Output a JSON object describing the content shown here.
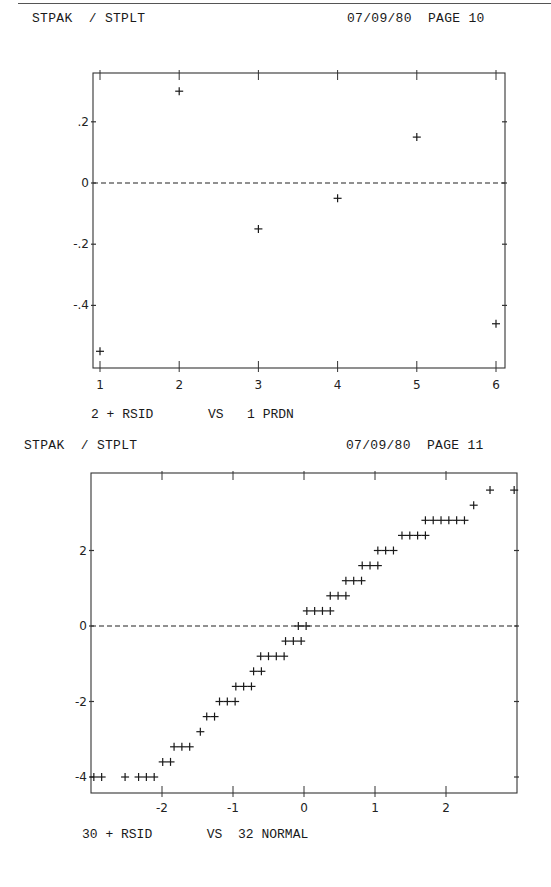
{
  "pages": [
    {
      "header_left": "STPAK  / STPLT",
      "header_right": "07/09/80  PAGE 10",
      "caption": "2 + RSID       VS   1 PRDN"
    },
    {
      "header_left": "STPAK  / STPLT",
      "header_right": "07/09/80  PAGE 11",
      "caption": "30 + RSID       VS  32 NORMAL"
    }
  ],
  "chart_data": [
    {
      "type": "scatter",
      "title": "STPAK / STPLT  07/09/80  PAGE 10",
      "xlabel": "1 PRDN",
      "ylabel": "2 + RSID",
      "marker": "+",
      "x_ticks": [
        "1",
        "2",
        "3",
        "4",
        "5",
        "6"
      ],
      "y_ticks": [
        ".2",
        "0",
        "-.2",
        "-.4"
      ],
      "xlim": [
        0.9,
        6.1
      ],
      "ylim": [
        -0.6,
        0.36
      ],
      "reference_line": {
        "y": 0,
        "style": "dashed"
      },
      "grid": false,
      "points": [
        {
          "x": 1,
          "y": -0.55
        },
        {
          "x": 2,
          "y": 0.3
        },
        {
          "x": 3,
          "y": -0.15
        },
        {
          "x": 4,
          "y": -0.05
        },
        {
          "x": 5,
          "y": 0.15
        },
        {
          "x": 6,
          "y": -0.46
        }
      ]
    },
    {
      "type": "scatter",
      "title": "STPAK / STPLT  07/09/80  PAGE 11",
      "xlabel": "32 NORMAL",
      "ylabel": "30 + RSID",
      "marker": "+",
      "x_ticks": [
        "-2",
        "-1",
        "0",
        "1",
        "2"
      ],
      "y_ticks": [
        "2",
        "0",
        "-2",
        "-4"
      ],
      "xlim": [
        -3.0,
        3.0
      ],
      "ylim": [
        -4.4,
        4.0
      ],
      "reference_line": {
        "y": 0,
        "style": "dashed"
      },
      "grid": false,
      "rows": [
        {
          "y": -4.0,
          "x": [
            -2.96,
            -2.85,
            -2.52,
            -2.33,
            -2.22,
            -2.11
          ]
        },
        {
          "y": -3.6,
          "x": [
            -1.99,
            -1.88
          ]
        },
        {
          "y": -3.2,
          "x": [
            -1.83,
            -1.72,
            -1.61
          ]
        },
        {
          "y": -2.8,
          "x": [
            -1.46
          ]
        },
        {
          "y": -2.4,
          "x": [
            -1.37,
            -1.26
          ]
        },
        {
          "y": -2.0,
          "x": [
            -1.19,
            -1.08,
            -0.97
          ]
        },
        {
          "y": -1.6,
          "x": [
            -0.96,
            -0.85,
            -0.74
          ]
        },
        {
          "y": -1.2,
          "x": [
            -0.71,
            -0.6
          ]
        },
        {
          "y": -0.8,
          "x": [
            -0.61,
            -0.5,
            -0.39,
            -0.28
          ]
        },
        {
          "y": -0.4,
          "x": [
            -0.26,
            -0.15,
            -0.04
          ]
        },
        {
          "y": 0.0,
          "x": [
            -0.08,
            0.03
          ]
        },
        {
          "y": 0.4,
          "x": [
            0.04,
            0.15,
            0.26,
            0.37
          ]
        },
        {
          "y": 0.8,
          "x": [
            0.37,
            0.48,
            0.59
          ]
        },
        {
          "y": 1.2,
          "x": [
            0.59,
            0.7,
            0.81
          ]
        },
        {
          "y": 1.6,
          "x": [
            0.82,
            0.93,
            1.04
          ]
        },
        {
          "y": 2.0,
          "x": [
            1.04,
            1.15,
            1.26
          ]
        },
        {
          "y": 2.4,
          "x": [
            1.38,
            1.49,
            1.6,
            1.71
          ]
        },
        {
          "y": 2.8,
          "x": [
            1.71,
            1.82,
            1.93,
            2.04,
            2.15,
            2.26
          ]
        },
        {
          "y": 3.2,
          "x": [
            2.39
          ]
        },
        {
          "y": 3.6,
          "x": [
            2.62,
            2.96
          ]
        }
      ]
    }
  ]
}
